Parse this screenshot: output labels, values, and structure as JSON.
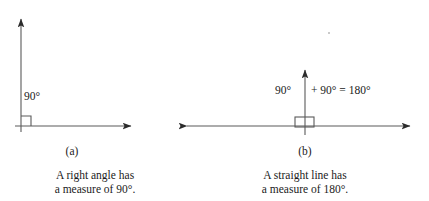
{
  "page": {
    "background_color": "#ffffff",
    "ink_color": "#1b1b1b",
    "line_color": "#4a4a4a",
    "width": 429,
    "height": 201
  },
  "figure_a": {
    "id": "figure-a",
    "angle_label": "90°",
    "sub_label": "(a)",
    "caption_line1": "A right angle has",
    "caption_line2": "a measure of 90°.",
    "geometry": {
      "vertex_x": 21,
      "baseline_y": 126,
      "vertical_tip_y": 15,
      "horizontal_tip_x": 136,
      "square_size": 10,
      "right_angle_marker": "right-angle-square"
    }
  },
  "figure_b": {
    "id": "figure-b",
    "equation_terms": [
      "90°",
      "+ 90° = 180°"
    ],
    "equation_full": "90° + 90° = 180°",
    "sub_label": "(b)",
    "caption_line1": "A straight line has",
    "caption_line2": "a measure of 180°.",
    "geometry": {
      "vertex_x": 305,
      "baseline_y": 126,
      "vertical_tip_y": 66,
      "left_tip_x": 182,
      "right_tip_x": 415,
      "square_left": 295,
      "square_right": 314,
      "square_top": 117,
      "right_angle_marker": "right-angle-square"
    }
  }
}
